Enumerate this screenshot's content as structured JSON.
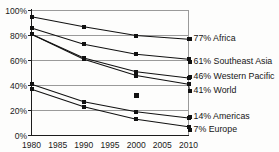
{
  "chart_data": {
    "type": "line",
    "title": "",
    "subtitle": "",
    "xlabel": "",
    "ylabel": "",
    "x": [
      1980,
      1990,
      2000,
      2010
    ],
    "xlim": [
      1980,
      2010
    ],
    "ylim": [
      0,
      100
    ],
    "xticks": [
      "1980",
      "1985",
      "1990",
      "1995",
      "2000",
      "2005",
      "2010"
    ],
    "xtick_values": [
      1980,
      1985,
      1990,
      1995,
      2000,
      2005,
      2010
    ],
    "yticks": [
      "0%",
      "20%",
      "40%",
      "60%",
      "80%",
      "100%"
    ],
    "ytick_values": [
      0,
      20,
      40,
      60,
      80,
      100
    ],
    "grid": true,
    "grid_axis": "y",
    "legend_position": "right-inline",
    "marker": "square",
    "line_color": "#111111",
    "grid_color": "#9a9a9a",
    "series": [
      {
        "name": "Africa",
        "label": "77% Africa",
        "end_value": 77,
        "values": [
          95,
          87,
          80,
          77
        ]
      },
      {
        "name": "Southeast Asia",
        "label": "61% Southeast Asia",
        "end_value": 61,
        "values": [
          86,
          73,
          65,
          61
        ]
      },
      {
        "name": "Western Pacific",
        "label": "46% Western Pacific",
        "end_value": 46,
        "values": [
          81,
          62,
          51,
          46
        ]
      },
      {
        "name": "World",
        "label": "41% World",
        "end_value": 41,
        "values": [
          81,
          61,
          48,
          41
        ]
      },
      {
        "name": "Americas",
        "label": "14% Americas",
        "end_value": 14,
        "values": [
          41,
          27,
          19,
          14
        ]
      },
      {
        "name": "Europe",
        "label": "7% Europe",
        "end_value": 7,
        "values": [
          37,
          23,
          13,
          7
        ]
      }
    ],
    "annotations": [
      {
        "name": "stray-data-point",
        "x": 2000,
        "y": 32,
        "text": ""
      }
    ]
  }
}
